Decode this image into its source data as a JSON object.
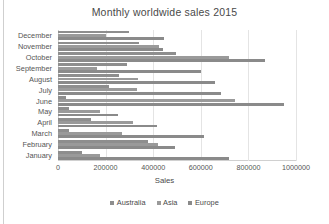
{
  "chart_data": {
    "type": "bar",
    "orientation": "horizontal",
    "title": "Monthly worldwide sales 2015",
    "xlabel": "Sales",
    "ylabel": "",
    "xlim": [
      0,
      1000000
    ],
    "xticks": [
      0,
      200000,
      400000,
      600000,
      800000,
      1000000
    ],
    "xtick_labels": [
      "0",
      "200000",
      "400000",
      "600000",
      "800000",
      "1000000"
    ],
    "grid": true,
    "legend_position": "bottom",
    "categories": [
      "December",
      "November",
      "October",
      "September",
      "August",
      "July",
      "June",
      "May",
      "April",
      "March",
      "February",
      "January"
    ],
    "series": [
      {
        "name": "Australia",
        "color": "#8e8e8e",
        "values": [
          300000,
          340000,
          495000,
          290000,
          255000,
          215000,
          35000,
          45000,
          140000,
          45000,
          380000,
          100000
        ]
      },
      {
        "name": "Asia",
        "color": "#9a9a9a",
        "values": [
          200000,
          425000,
          720000,
          165000,
          335000,
          330000,
          745000,
          175000,
          315000,
          270000,
          420000,
          175000
        ]
      },
      {
        "name": "Europe",
        "color": "#8a8a8a",
        "values": [
          445000,
          440000,
          870000,
          600000,
          660000,
          685000,
          950000,
          250000,
          415000,
          615000,
          490000,
          720000
        ]
      }
    ]
  }
}
